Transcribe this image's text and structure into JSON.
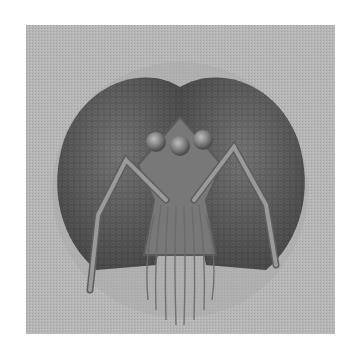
{
  "image": {
    "subject": "Engraving-style illustration of an insect head (front view) with compound eyes, three ocelli, antennae and hairy face",
    "colors": {
      "background": "#ffffff",
      "frame": "#b4b4b4",
      "halo": "#a6a6a6",
      "eyes": "#6a6a6a",
      "eye_dark": "#555555",
      "face": "#7a7a7a",
      "ocelli": "#8c8c8c",
      "antenna": "#909090",
      "hair": "#8a8a8a"
    },
    "features": {
      "ocelli_count": 3,
      "antennae_count": 2
    }
  }
}
